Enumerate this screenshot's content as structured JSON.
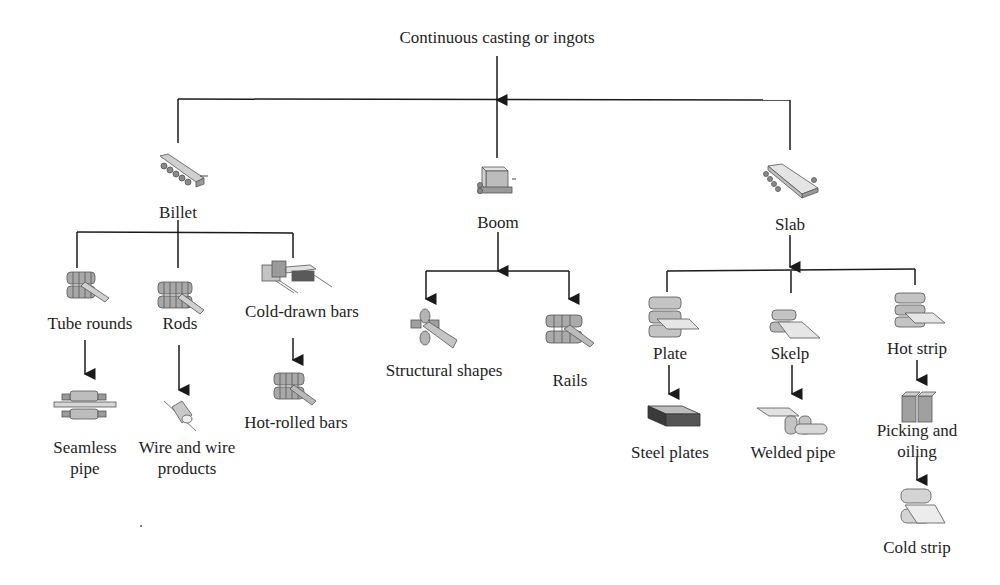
{
  "diagram": {
    "root": "Continuous casting or ingots",
    "level1": {
      "billet": "Billet",
      "boom": "Boom",
      "slab": "Slab"
    },
    "billet_products": {
      "tube_rounds": "Tube rounds",
      "rods": "Rods",
      "cold_drawn_bars": "Cold-drawn bars",
      "seamless_pipe_line1": "Seamless",
      "seamless_pipe_line2": "pipe",
      "wire_line1": "Wire and wire",
      "wire_line2": "products",
      "hot_rolled_bars": "Hot-rolled bars"
    },
    "boom_products": {
      "structural_shapes": "Structural shapes",
      "rails": "Rails"
    },
    "slab_products": {
      "plate": "Plate",
      "skelp": "Skelp",
      "hot_strip": "Hot strip",
      "steel_plates": "Steel plates",
      "welded_pipe": "Welded pipe",
      "picking_line1": "Picking and",
      "picking_line2": "oiling",
      "cold_strip": "Cold strip"
    }
  },
  "colors": {
    "line": "#1a1a1a",
    "icon_fill": "#bdbdbd",
    "icon_dark": "#6e6e6e",
    "text": "#1e1e1e"
  }
}
